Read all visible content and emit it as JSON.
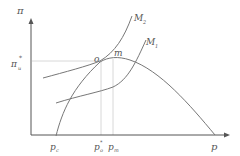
{
  "diagram": {
    "y_axis_label": "π",
    "x_axis_label": "p",
    "pi_star_label": "π",
    "pi_star_sup": "*",
    "pi_star_sub": "u",
    "curves": {
      "m2_label": "M",
      "m2_sub": "2",
      "m1_label": "M",
      "m1_sub": "1"
    },
    "points": {
      "o_label": "o",
      "m_label": "m"
    },
    "x_ticks": {
      "pc_label": "p",
      "pc_sub": "c",
      "po_label": "p",
      "po_sup": "*",
      "po_sub": "o",
      "pm_label": "p",
      "pm_sub": "m"
    },
    "colors": {
      "axis": "#555555",
      "curve": "#777777",
      "guide": "#d8d8d8"
    }
  }
}
